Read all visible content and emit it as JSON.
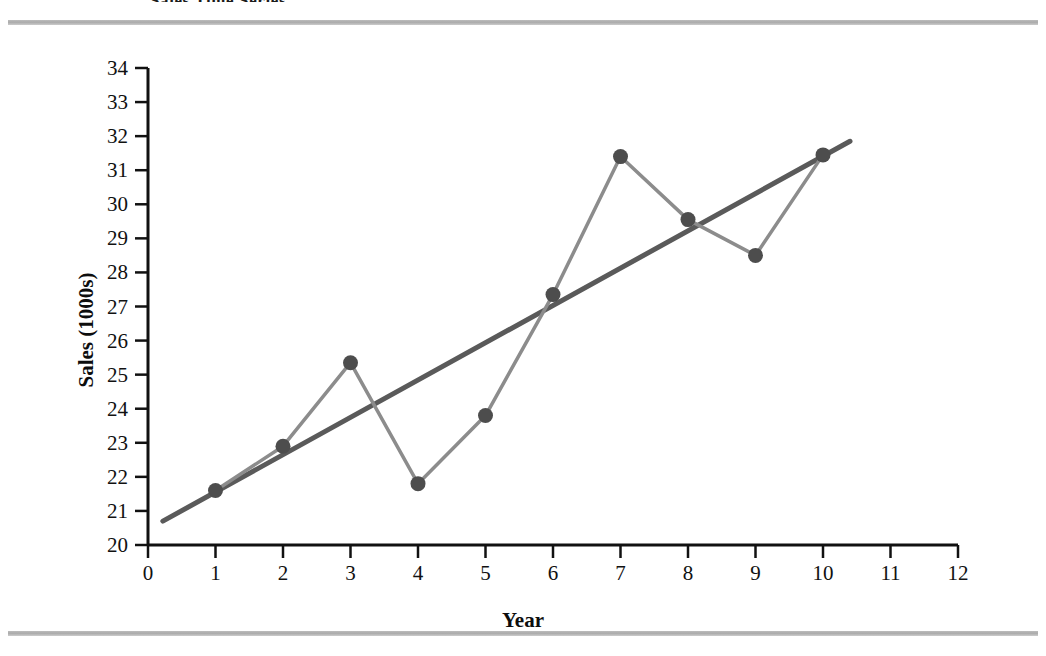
{
  "page": {
    "heading": "Sales Time Series",
    "background_color": "#ffffff",
    "rule_color": "#b2b2b2"
  },
  "chart_data": {
    "type": "line",
    "title": "Sales Time Series",
    "xlabel": "Year",
    "ylabel": "Sales (1000s)",
    "xlim": [
      0,
      12
    ],
    "ylim": [
      20,
      34
    ],
    "xticks": [
      0,
      1,
      2,
      3,
      4,
      5,
      6,
      7,
      8,
      9,
      10,
      11,
      12
    ],
    "yticks": [
      20,
      21,
      22,
      23,
      24,
      25,
      26,
      27,
      28,
      29,
      30,
      31,
      32,
      33,
      34
    ],
    "grid": false,
    "legend": "none",
    "x": [
      1,
      2,
      3,
      4,
      5,
      6,
      7,
      8,
      9,
      10
    ],
    "series": [
      {
        "name": "Sales",
        "style": "line-with-markers",
        "color": "#8c8c8c",
        "marker_color": "#4d4d4d",
        "values": [
          21.6,
          22.9,
          25.35,
          21.8,
          23.8,
          27.35,
          31.4,
          29.55,
          28.5,
          31.45
        ]
      },
      {
        "name": "Linear trend",
        "style": "line",
        "color": "#5a5a5a",
        "x_start": 0.22,
        "x_end": 10.4,
        "y_start": 20.7,
        "y_end": 31.85,
        "slope": 1.095,
        "intercept": 20.46
      }
    ]
  },
  "axis": {
    "x_tick_labels": [
      "0",
      "1",
      "2",
      "3",
      "4",
      "5",
      "6",
      "7",
      "8",
      "9",
      "10",
      "11",
      "12"
    ],
    "y_tick_labels": [
      "34",
      "33",
      "32",
      "31",
      "30",
      "29",
      "28",
      "27",
      "26",
      "25",
      "24",
      "23",
      "22",
      "21",
      "20"
    ],
    "x_title": "Year",
    "y_title": "Sales (1000s)",
    "axis_color": "#111111"
  }
}
